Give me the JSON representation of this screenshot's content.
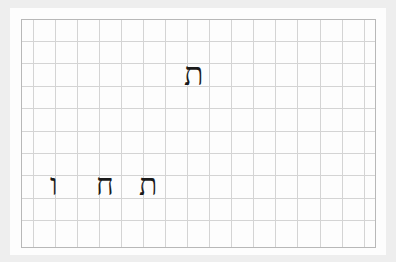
{
  "worksheet": {
    "grid": {
      "left": 21,
      "top": 19,
      "right": 375,
      "bottom": 247,
      "vertical_lines": [
        33,
        55,
        77,
        99,
        121,
        143,
        165,
        187,
        209,
        231,
        253,
        275,
        297,
        320,
        342,
        364
      ],
      "horizontal_lines": [
        41,
        63,
        86,
        108,
        131,
        153,
        175,
        198,
        220
      ],
      "line_color": "#d4d4d4",
      "border_color": "#b8b8b8"
    },
    "letters": [
      {
        "char": "ת",
        "name": "tav",
        "x": 186,
        "y": 60,
        "size": 30
      },
      {
        "char": "ו",
        "name": "vav",
        "x": 51,
        "y": 174,
        "size": 26
      },
      {
        "char": "ח",
        "name": "het",
        "x": 97,
        "y": 174,
        "size": 28
      },
      {
        "char": "ת",
        "name": "tav",
        "x": 140,
        "y": 174,
        "size": 28
      }
    ]
  }
}
